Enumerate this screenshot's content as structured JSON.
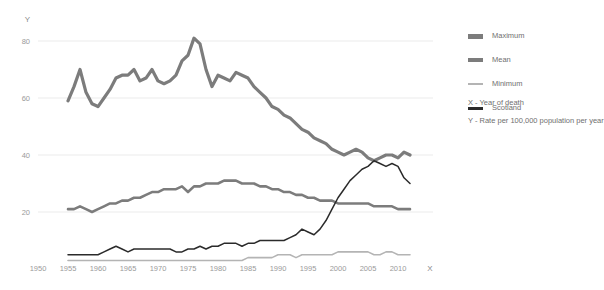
{
  "axes": {
    "y_axis_label": "Y",
    "x_axis_label": "X",
    "y_ticks": [
      "20",
      "40",
      "60",
      "80"
    ],
    "x_ticks": [
      "1950",
      "1955",
      "1960",
      "1965",
      "1970",
      "1975",
      "1980",
      "1985",
      "1990",
      "1995",
      "2000",
      "2005",
      "2010"
    ]
  },
  "legend": {
    "items": [
      {
        "label": "Maximum",
        "swatch": "max-swatch",
        "color": "#7c7c7c"
      },
      {
        "label": "Mean",
        "swatch": "mean-swatch",
        "color": "#7c7c7c"
      },
      {
        "label": "Minimum",
        "swatch": "min-swatch",
        "color": "#b4b4b4"
      },
      {
        "label": "Scotland",
        "swatch": "scotland-swatch",
        "color": "#2b2b2b"
      }
    ],
    "note_x": "X - Year of death",
    "note_y": "Y - Rate per 100,000 population per year"
  },
  "chart_data": {
    "type": "line",
    "title": "",
    "xlabel": "Year of death",
    "ylabel": "Rate per 100,000 population per year",
    "xlim": [
      1950,
      2013
    ],
    "ylim": [
      0,
      86
    ],
    "grid": true,
    "legend_position": "right",
    "x": [
      1955,
      1956,
      1957,
      1958,
      1959,
      1960,
      1961,
      1962,
      1963,
      1964,
      1965,
      1966,
      1967,
      1968,
      1969,
      1970,
      1971,
      1972,
      1973,
      1974,
      1975,
      1976,
      1977,
      1978,
      1979,
      1980,
      1981,
      1982,
      1983,
      1984,
      1985,
      1986,
      1987,
      1988,
      1989,
      1990,
      1991,
      1992,
      1993,
      1994,
      1995,
      1996,
      1997,
      1998,
      1999,
      2000,
      2001,
      2002,
      2003,
      2004,
      2005,
      2006,
      2007,
      2008,
      2009,
      2010,
      2011,
      2012
    ],
    "series": [
      {
        "name": "Maximum",
        "color": "#7c7c7c",
        "width": 3.2,
        "values": [
          59,
          64,
          70,
          62,
          58,
          57,
          60,
          63,
          67,
          68,
          68,
          70,
          66,
          67,
          70,
          66,
          65,
          66,
          68,
          73,
          75,
          81,
          79,
          70,
          64,
          68,
          67,
          66,
          69,
          68,
          67,
          64,
          62,
          60,
          57,
          56,
          54,
          53,
          51,
          49,
          48,
          46,
          45,
          44,
          42,
          41,
          40,
          41,
          42,
          41,
          39,
          38,
          39,
          40,
          40,
          39,
          41,
          40
        ]
      },
      {
        "name": "Mean",
        "color": "#7c7c7c",
        "width": 2.6,
        "values": [
          21,
          21,
          22,
          21,
          20,
          21,
          22,
          23,
          23,
          24,
          24,
          25,
          25,
          26,
          27,
          27,
          28,
          28,
          28,
          29,
          27,
          29,
          29,
          30,
          30,
          30,
          31,
          31,
          31,
          30,
          30,
          30,
          29,
          29,
          28,
          28,
          27,
          27,
          26,
          26,
          25,
          25,
          24,
          24,
          24,
          23,
          23,
          23,
          23,
          23,
          23,
          22,
          22,
          22,
          22,
          21,
          21,
          21
        ]
      },
      {
        "name": "Minimum",
        "color": "#b4b4b4",
        "width": 1.6,
        "values": [
          3,
          3,
          3,
          3,
          3,
          3,
          3,
          3,
          3,
          3,
          3,
          3,
          3,
          3,
          3,
          3,
          3,
          3,
          3,
          3,
          3,
          3,
          3,
          3,
          3,
          3,
          3,
          3,
          3,
          3,
          4,
          4,
          4,
          4,
          4,
          5,
          5,
          5,
          4,
          5,
          5,
          5,
          5,
          5,
          5,
          6,
          6,
          6,
          6,
          6,
          6,
          5,
          5,
          6,
          6,
          5,
          5,
          5
        ]
      },
      {
        "name": "Scotland",
        "color": "#2b2b2b",
        "width": 1.5,
        "values": [
          5,
          5,
          5,
          5,
          5,
          5,
          6,
          7,
          8,
          7,
          6,
          7,
          7,
          7,
          7,
          7,
          7,
          7,
          6,
          6,
          7,
          7,
          8,
          7,
          8,
          8,
          9,
          9,
          9,
          8,
          9,
          9,
          10,
          10,
          10,
          10,
          10,
          11,
          12,
          14,
          13,
          12,
          14,
          17,
          21,
          25,
          28,
          31,
          33,
          35,
          36,
          38,
          37,
          36,
          37,
          36,
          32,
          30
        ]
      }
    ]
  }
}
